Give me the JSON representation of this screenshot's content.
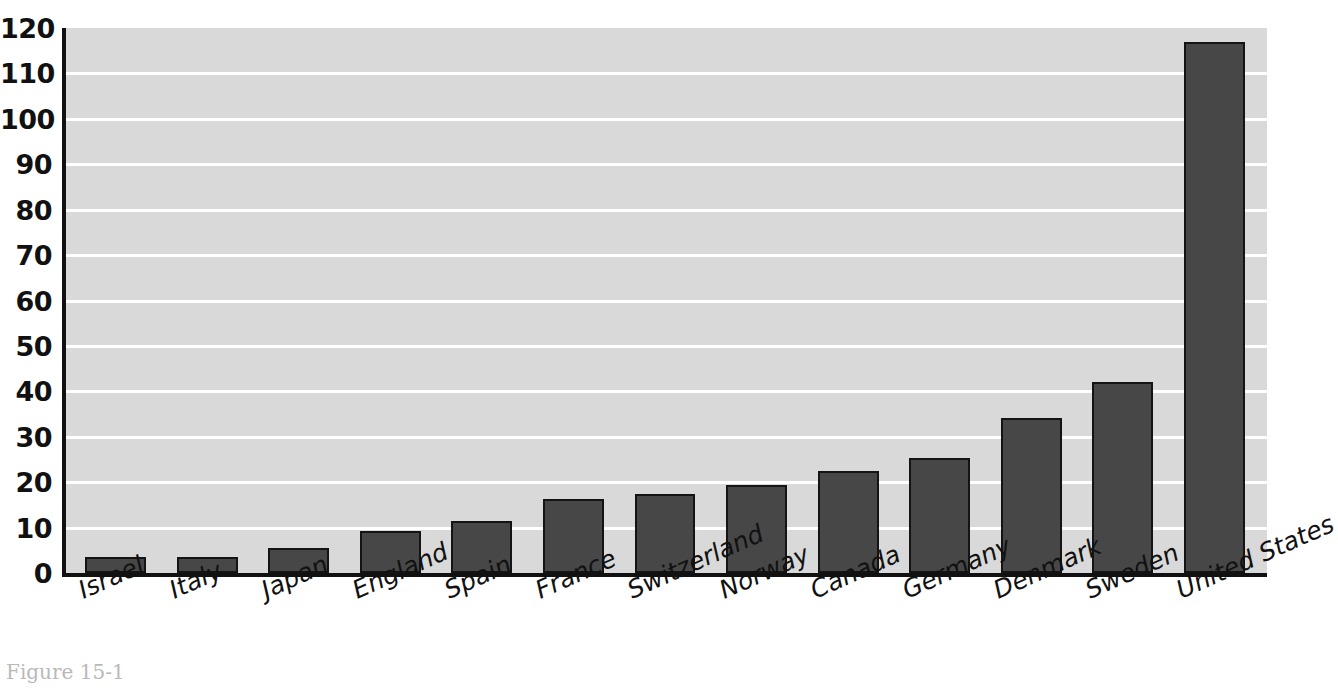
{
  "chart_data": {
    "type": "bar",
    "title": "",
    "xlabel": "",
    "ylabel": "",
    "ylim": [
      0,
      120
    ],
    "ytick_step": 10,
    "yticks": [
      120,
      110,
      100,
      90,
      80,
      70,
      60,
      50,
      40,
      30,
      20,
      10,
      0
    ],
    "grid": true,
    "grid_axis": "y",
    "legend": "none",
    "categories": [
      "Israel",
      "Italy",
      "Japan",
      "England",
      "Spain",
      "France",
      "Switzerland",
      "Norway",
      "Canada",
      "Germany",
      "Denmark",
      "Sweden",
      "United States"
    ],
    "values": [
      3.6,
      3.6,
      5.5,
      9.3,
      11.4,
      16.3,
      17.4,
      19.4,
      22.4,
      25.3,
      34.2,
      42.1,
      117.0
    ],
    "colors": {
      "bar_fill": "#474747",
      "bar_edge": "#141414",
      "plot_background": "#d9d9d9",
      "gridline": "#ffffff",
      "axis": "#111111",
      "figure_background": "#ffffff",
      "tick_label": "#111111"
    }
  },
  "caption": {
    "text": "Figure 15-1"
  }
}
